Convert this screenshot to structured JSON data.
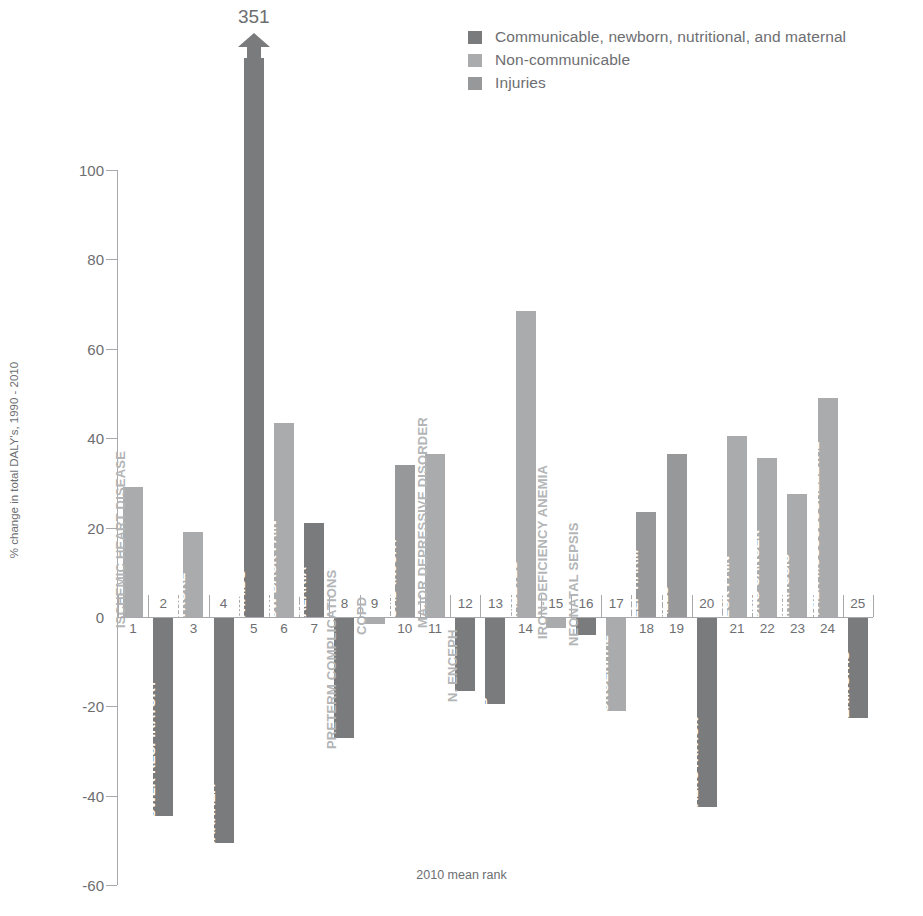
{
  "legend": {
    "items": [
      {
        "label": "Communicable, newborn, nutritional, and maternal",
        "color": "#7a7b7d",
        "key": "communicable"
      },
      {
        "label": "Non-communicable",
        "color": "#a9abad",
        "key": "noncommunicable"
      },
      {
        "label": "Injuries",
        "color": "#96989a",
        "key": "injuries"
      }
    ]
  },
  "axes": {
    "y_title": "% change  in total DALY's, 1990 - 2010",
    "x_title": "2010 mean rank",
    "y_ticks": [
      "100",
      "80",
      "60",
      "40",
      "20",
      "0",
      "-20",
      "-40",
      "-60"
    ]
  },
  "annotation": {
    "overflow_label": "351",
    "overflow_rank": 5
  },
  "chart_data": {
    "type": "bar",
    "title": "",
    "xlabel": "2010 mean rank",
    "ylabel": "% change  in total DALY's, 1990 - 2010",
    "ylim": [
      -60,
      100
    ],
    "grid": false,
    "legend_position": "top-right",
    "categories": [
      "ISCHEMIC HEART DISEASE",
      "LOWER RESPIRATORY",
      "STROKE",
      "DIARRHEA",
      "HIV/AIDS",
      "LOW BACK PAIN",
      "MALARIA",
      "PRETERM COMPLICATIONS",
      "COPD",
      "ROAD INJURY",
      "MAJOR DEPRESSIVE DISORDER",
      "N. ENCEPH",
      "TB",
      "DIABETES",
      "IRON-DEFICIENCY ANEMIA",
      "NEONATAL SEPSIS",
      "CONGENITAL",
      "SELF-HARM",
      "FALLS",
      "MALNUTRITION",
      "NECK PAIN",
      "LUNG CANCER",
      "CIRRHOSIS",
      "OTHER MUSCULOSKELETAL",
      "MENINGITIS"
    ],
    "ranks": [
      1,
      2,
      3,
      4,
      5,
      6,
      7,
      8,
      9,
      10,
      11,
      12,
      13,
      14,
      15,
      16,
      17,
      18,
      19,
      20,
      21,
      22,
      23,
      24,
      25
    ],
    "values": [
      29,
      -44.5,
      19,
      -50.5,
      351,
      43.5,
      21,
      -27,
      -1.5,
      34,
      36.5,
      -16.5,
      -19.5,
      68.5,
      -2.5,
      -4,
      -21,
      23.5,
      36.5,
      -42.5,
      40.5,
      35.5,
      27.5,
      49,
      -22.5
    ],
    "groups": [
      "noncommunicable",
      "communicable",
      "noncommunicable",
      "communicable",
      "communicable",
      "noncommunicable",
      "communicable",
      "communicable",
      "noncommunicable",
      "injuries",
      "noncommunicable",
      "communicable",
      "communicable",
      "noncommunicable",
      "noncommunicable",
      "communicable",
      "noncommunicable",
      "injuries",
      "injuries",
      "communicable",
      "noncommunicable",
      "noncommunicable",
      "noncommunicable",
      "noncommunicable",
      "communicable"
    ],
    "clipped": [
      false,
      false,
      false,
      false,
      true,
      false,
      false,
      false,
      false,
      false,
      false,
      false,
      false,
      false,
      false,
      false,
      false,
      false,
      false,
      false,
      false,
      false,
      false,
      false,
      false
    ]
  }
}
